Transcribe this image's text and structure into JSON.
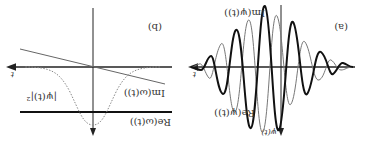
{
  "figure": {
    "orientation": "rotated-180",
    "panel_a": {
      "label": "(a)",
      "x_axis_label": "t",
      "y_axis_label": "ψ(t)",
      "curves": [
        {
          "name": "Re(ψ(t))",
          "style": "thick",
          "color": "#111111"
        },
        {
          "name": "Im(ψ(t))",
          "style": "thin",
          "color": "#777777"
        }
      ]
    },
    "panel_b": {
      "label": "(b)",
      "x_axis_label": "t",
      "curves": [
        {
          "name": "Re(ω(t))",
          "style": "thick-horizontal",
          "color": "#111111"
        },
        {
          "name": "Im(ω(t))",
          "style": "thin-sloped",
          "color": "#666666"
        },
        {
          "name": "|ψ(t)|²",
          "style": "dotted-gaussian",
          "color": "#888888"
        }
      ]
    }
  }
}
